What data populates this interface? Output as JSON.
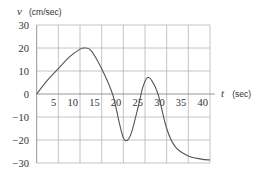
{
  "chart_data": {
    "type": "line",
    "title": "",
    "xlabel": "t (sec)",
    "ylabel": "v (cm/sec)",
    "xlabel_var": "t",
    "xlabel_unit": "(sec)",
    "ylabel_var": "v",
    "ylabel_unit": "(cm/sec)",
    "xlim": [
      0,
      40
    ],
    "ylim": [
      -30,
      30
    ],
    "grid": true,
    "legend": null,
    "x_ticks": [
      5,
      10,
      15,
      20,
      25,
      30,
      35,
      40
    ],
    "x_tick_labels": [
      "5",
      "10",
      "15",
      "20",
      "25",
      "30",
      "35",
      "40"
    ],
    "y_ticks": [
      30,
      20,
      10,
      0,
      -10,
      -20,
      -30
    ],
    "y_tick_labels": [
      "30",
      "20",
      "10",
      "0",
      "−10",
      "−20",
      "−30"
    ],
    "series": [
      {
        "name": "v(t)",
        "x": [
          0,
          2.5,
          5,
          7.5,
          10,
          11,
          12.5,
          15,
          17.5,
          19,
          20,
          21,
          22,
          23.5,
          24.5,
          25.5,
          26.5,
          28,
          30,
          32,
          35,
          38,
          40
        ],
        "values": [
          0,
          6,
          11,
          16,
          19.5,
          20,
          19,
          11,
          0,
          -12,
          -19,
          -20,
          -16,
          -5,
          3,
          7,
          6,
          0,
          -15,
          -23,
          -27,
          -28.3,
          -28.7
        ]
      }
    ]
  }
}
